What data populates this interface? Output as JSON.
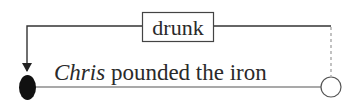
{
  "diagram": {
    "label_box": {
      "text": "drunk"
    },
    "sentence": {
      "subject": "Chris",
      "rest": " pounded the iron"
    },
    "colors": {
      "line": "#333333",
      "dashed": "#999999",
      "filled_node": "#111111",
      "open_node": "#ffffff"
    }
  }
}
